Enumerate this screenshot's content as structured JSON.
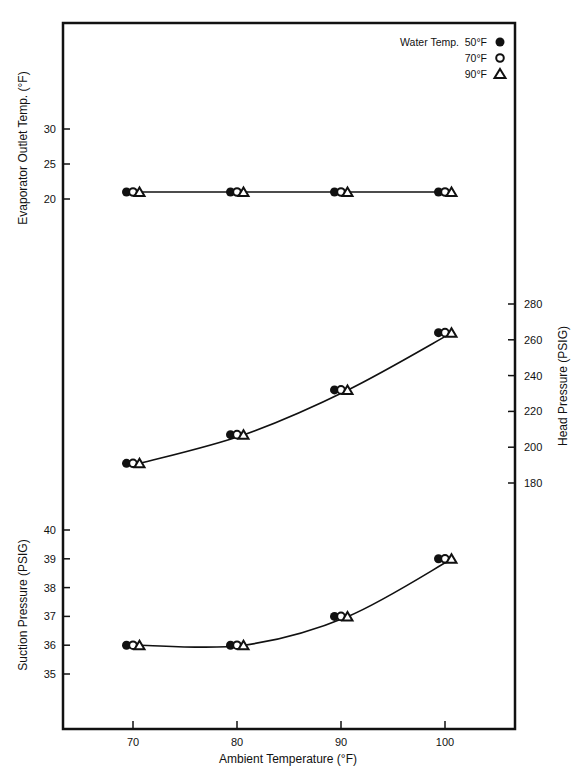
{
  "header": {
    "cropped_text": ""
  },
  "legend": {
    "title": "Water Temp.",
    "entries": [
      {
        "label": "50°F",
        "marker": "filled-circle"
      },
      {
        "label": "70°F",
        "marker": "open-circle"
      },
      {
        "label": "90°F",
        "marker": "open-triangle"
      }
    ]
  },
  "chart_data": {
    "type": "line",
    "title": "",
    "xlabel": "Ambient Temperature (°F)",
    "x": [
      70,
      80,
      90,
      100
    ],
    "x_ticks": [
      "70",
      "80",
      "90",
      "100"
    ],
    "grid": false,
    "legend_position": "top-right",
    "panels": [
      {
        "name": "evaporator",
        "ylabel": "Evaporator Outlet Temp. (°F)",
        "axis_side": "left",
        "y_ticks": [
          20,
          25,
          30
        ],
        "series": [
          {
            "name": "50°F",
            "marker": "filled-circle",
            "values": [
              21,
              21,
              21,
              21
            ]
          },
          {
            "name": "70°F",
            "marker": "open-circle",
            "values": [
              21,
              21,
              21,
              21
            ]
          },
          {
            "name": "90°F",
            "marker": "open-triangle",
            "values": [
              21,
              21,
              21,
              21
            ]
          }
        ]
      },
      {
        "name": "head-pressure",
        "ylabel": "Head Pressure (PSIG)",
        "axis_side": "right",
        "y_ticks": [
          180,
          200,
          220,
          240,
          260,
          280
        ],
        "series": [
          {
            "name": "50°F",
            "marker": "filled-circle",
            "values": [
              191,
              207,
              232,
              264
            ]
          },
          {
            "name": "70°F",
            "marker": "open-circle",
            "values": [
              191,
              207,
              232,
              264
            ]
          },
          {
            "name": "90°F",
            "marker": "open-triangle",
            "values": [
              191,
              207,
              232,
              264
            ]
          }
        ]
      },
      {
        "name": "suction-pressure",
        "ylabel": "Suction Pressure (PSIG)",
        "axis_side": "left",
        "y_ticks": [
          35,
          36,
          37,
          38,
          39,
          40
        ],
        "series": [
          {
            "name": "50°F",
            "marker": "filled-circle",
            "values": [
              36,
              36,
              37,
              39
            ]
          },
          {
            "name": "70°F",
            "marker": "open-circle",
            "values": [
              36,
              36,
              37,
              39
            ]
          },
          {
            "name": "90°F",
            "marker": "open-triangle",
            "values": [
              36,
              36,
              37,
              39
            ]
          }
        ]
      }
    ]
  },
  "colors": {
    "ink": "#111111",
    "background": "#ffffff"
  }
}
